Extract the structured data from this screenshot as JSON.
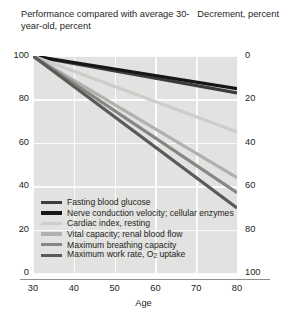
{
  "header": {
    "left_title": "Performance compared with average 30-year-old, percent",
    "right_title": "Decrement, percent"
  },
  "axes": {
    "x_label": "Age",
    "x_ticks": [
      "30",
      "40",
      "50",
      "60",
      "70",
      "80"
    ],
    "y_left_ticks": [
      "100",
      "80",
      "60",
      "40",
      "20",
      "0"
    ],
    "y_right_ticks": [
      "0",
      "20",
      "40",
      "60",
      "80",
      "100"
    ]
  },
  "legend": {
    "items": [
      {
        "label": "Fasting blood glucose",
        "color": "#3c3c3c"
      },
      {
        "label": "Nerve conduction velocity; cellular enzymes",
        "color": "#161616"
      },
      {
        "label": "Cardiac index, resting",
        "color": "#cdcdcb"
      },
      {
        "label": "Vital capacity; renal blood flow",
        "color": "#b0b0ae"
      },
      {
        "label": "Maximum breathing capacity",
        "color": "#868684"
      },
      {
        "label": "Maximum work rate, O₂ uptake",
        "color": "#5a5a58"
      }
    ]
  },
  "chart_data": {
    "type": "line",
    "title": "Performance compared with average 30-year-old, percent",
    "xlabel": "Age",
    "ylabel": "Performance compared with average 30-year-old, percent",
    "y2label": "Decrement, percent",
    "xlim": [
      30,
      80
    ],
    "ylim": [
      0,
      100
    ],
    "y2lim": [
      100,
      0
    ],
    "grid": true,
    "legend_position": "inside-bottom-left",
    "x": [
      30,
      80
    ],
    "series": [
      {
        "name": "Fasting blood glucose",
        "values": [
          100,
          83
        ],
        "decrement": [
          0,
          17
        ],
        "color": "#3c3c3c"
      },
      {
        "name": "Nerve conduction velocity; cellular enzymes",
        "values": [
          100,
          85
        ],
        "decrement": [
          0,
          15
        ],
        "color": "#161616"
      },
      {
        "name": "Cardiac index, resting",
        "values": [
          100,
          65
        ],
        "decrement": [
          0,
          35
        ],
        "color": "#cdcdcb"
      },
      {
        "name": "Vital capacity; renal blood flow",
        "values": [
          100,
          44
        ],
        "decrement": [
          0,
          56
        ],
        "color": "#b0b0ae"
      },
      {
        "name": "Maximum breathing capacity",
        "values": [
          100,
          37
        ],
        "decrement": [
          0,
          63
        ],
        "color": "#868684"
      },
      {
        "name": "Maximum work rate, O₂ uptake",
        "values": [
          100,
          30
        ],
        "decrement": [
          0,
          70
        ],
        "color": "#5a5a58"
      }
    ]
  }
}
